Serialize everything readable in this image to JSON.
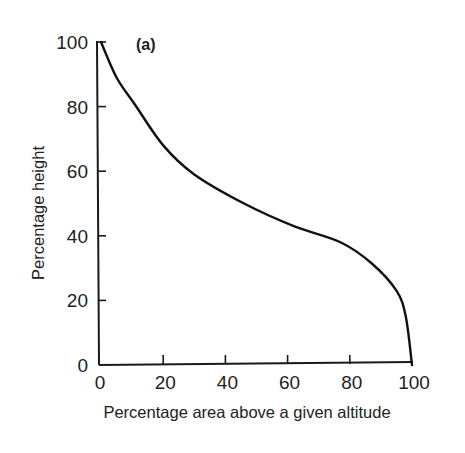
{
  "chart_data": {
    "type": "line",
    "title": "",
    "panel_label": "(a)",
    "xlabel": "Percentage area above a given altitude",
    "ylabel": "Percentage height",
    "xlim": [
      0,
      100
    ],
    "ylim": [
      0,
      100
    ],
    "xticks": [
      0,
      20,
      40,
      60,
      80,
      100
    ],
    "yticks": [
      0,
      20,
      40,
      60,
      80,
      100
    ],
    "grid": false,
    "legend": null,
    "series": [
      {
        "name": "hypsometric curve",
        "x": [
          0,
          5,
          11,
          20,
          30,
          46,
          62,
          77,
          87,
          95,
          98,
          100
        ],
        "y": [
          100,
          89,
          80.5,
          68,
          59,
          50,
          43,
          38,
          31.5,
          23,
          15,
          0
        ]
      }
    ]
  }
}
